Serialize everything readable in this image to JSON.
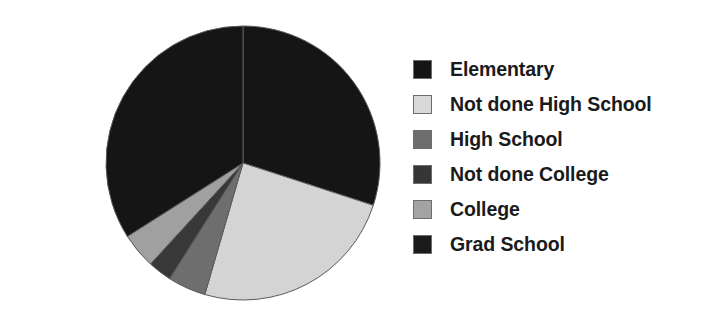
{
  "chart_data": {
    "type": "pie",
    "title": "",
    "subtitle": "",
    "xlabel": "",
    "ylabel": "",
    "grid": false,
    "legend_position": "right",
    "start_angle_deg": 0,
    "direction": "clockwise",
    "center": {
      "x": 243,
      "y": 163
    },
    "radius": 137,
    "categories": [
      "Elementary",
      "Not done High School",
      "High School",
      "Not done College",
      "College",
      "Grad School"
    ],
    "values": [
      30.0,
      24.5,
      4.5,
      2.8,
      4.2,
      34.0
    ],
    "colors": [
      "#151515",
      "#d4d4d4",
      "#6e6e6e",
      "#383838",
      "#a0a0a0",
      "#151515"
    ],
    "slice_edge_color": "#5a5a5a",
    "slices": [
      {
        "label": "Elementary",
        "value": 30.0,
        "color": "#151515",
        "start_deg": 0.0,
        "end_deg": 108.0
      },
      {
        "label": "Not done High School",
        "value": 24.5,
        "color": "#d4d4d4",
        "start_deg": 108.0,
        "end_deg": 196.2
      },
      {
        "label": "High School",
        "value": 4.5,
        "color": "#6e6e6e",
        "start_deg": 196.2,
        "end_deg": 212.4
      },
      {
        "label": "Not done College",
        "value": 2.8,
        "color": "#383838",
        "start_deg": 212.4,
        "end_deg": 222.5
      },
      {
        "label": "College",
        "value": 4.2,
        "color": "#a0a0a0",
        "start_deg": 222.5,
        "end_deg": 237.6
      },
      {
        "label": "Grad School",
        "value": 34.0,
        "color": "#151515",
        "start_deg": 237.6,
        "end_deg": 360.0
      }
    ]
  },
  "legend": {
    "items": [
      {
        "label": "Elementary",
        "color": "#151515",
        "swatch_name": "legend-swatch-elementary"
      },
      {
        "label": "Not done High School",
        "color": "#d9d9d9",
        "swatch_name": "legend-swatch-not-done-high-school"
      },
      {
        "label": "High School",
        "color": "#6e6e6e",
        "swatch_name": "legend-swatch-high-school"
      },
      {
        "label": "Not done College",
        "color": "#363636",
        "swatch_name": "legend-swatch-not-done-college"
      },
      {
        "label": "College",
        "color": "#a3a3a3",
        "swatch_name": "legend-swatch-college"
      },
      {
        "label": "Grad School",
        "color": "#1b1b1b",
        "swatch_name": "legend-swatch-grad-school"
      }
    ]
  }
}
